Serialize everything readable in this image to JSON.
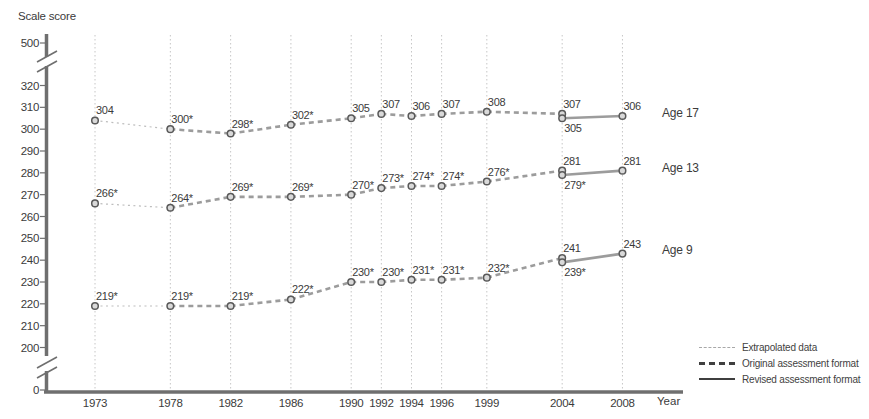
{
  "chart_data": {
    "type": "line",
    "ylabel": "Scale score",
    "xlabel": "Year",
    "x_years": [
      1973,
      1978,
      1982,
      1986,
      1990,
      1992,
      1994,
      1996,
      1999,
      2004,
      2008
    ],
    "y_axis": {
      "ticks": [
        320,
        310,
        300,
        290,
        280,
        270,
        260,
        250,
        240,
        230,
        220,
        210,
        200
      ],
      "top_tick": 500,
      "bottom_tick": 0,
      "has_axis_breaks": true
    },
    "grid": "vertical-dotted",
    "legend_position": "bottom-right",
    "series": [
      {
        "name": "Age 17",
        "points": [
          {
            "year": 1973,
            "value": 304,
            "label": "304",
            "label_pos": "above",
            "to_next": "extrapolated"
          },
          {
            "year": 1978,
            "value": 300,
            "label": "300*",
            "label_pos": "above",
            "to_next": "original"
          },
          {
            "year": 1982,
            "value": 298,
            "label": "298*",
            "label_pos": "above",
            "to_next": "original"
          },
          {
            "year": 1986,
            "value": 302,
            "label": "302*",
            "label_pos": "above",
            "to_next": "original"
          },
          {
            "year": 1990,
            "value": 305,
            "label": "305",
            "label_pos": "above",
            "to_next": "original"
          },
          {
            "year": 1992,
            "value": 307,
            "label": "307",
            "label_pos": "above",
            "to_next": "original"
          },
          {
            "year": 1994,
            "value": 306,
            "label": "306",
            "label_pos": "above",
            "to_next": "original"
          },
          {
            "year": 1996,
            "value": 307,
            "label": "307",
            "label_pos": "above",
            "to_next": "original"
          },
          {
            "year": 1999,
            "value": 308,
            "label": "308",
            "label_pos": "above",
            "to_next": "original"
          },
          {
            "year": 2004,
            "value": 307,
            "label": "307",
            "label_pos": "above",
            "to_next": "none",
            "format": "original"
          },
          {
            "year": 2004,
            "value": 305,
            "label": "305",
            "label_pos": "below",
            "to_next": "revised",
            "format": "revised"
          },
          {
            "year": 2008,
            "value": 306,
            "label": "306",
            "label_pos": "above",
            "to_next": "none",
            "format": "revised"
          }
        ]
      },
      {
        "name": "Age 13",
        "points": [
          {
            "year": 1973,
            "value": 266,
            "label": "266*",
            "label_pos": "above",
            "to_next": "extrapolated"
          },
          {
            "year": 1978,
            "value": 264,
            "label": "264*",
            "label_pos": "above",
            "to_next": "original"
          },
          {
            "year": 1982,
            "value": 269,
            "label": "269*",
            "label_pos": "above",
            "to_next": "original"
          },
          {
            "year": 1986,
            "value": 269,
            "label": "269*",
            "label_pos": "above",
            "to_next": "original"
          },
          {
            "year": 1990,
            "value": 270,
            "label": "270*",
            "label_pos": "above",
            "to_next": "original"
          },
          {
            "year": 1992,
            "value": 273,
            "label": "273*",
            "label_pos": "above",
            "to_next": "original"
          },
          {
            "year": 1994,
            "value": 274,
            "label": "274*",
            "label_pos": "above",
            "to_next": "original"
          },
          {
            "year": 1996,
            "value": 274,
            "label": "274*",
            "label_pos": "above",
            "to_next": "original"
          },
          {
            "year": 1999,
            "value": 276,
            "label": "276*",
            "label_pos": "above",
            "to_next": "original"
          },
          {
            "year": 2004,
            "value": 281,
            "label": "281",
            "label_pos": "above",
            "to_next": "none",
            "format": "original"
          },
          {
            "year": 2004,
            "value": 279,
            "label": "279*",
            "label_pos": "below",
            "to_next": "revised",
            "format": "revised"
          },
          {
            "year": 2008,
            "value": 281,
            "label": "281",
            "label_pos": "above",
            "to_next": "none",
            "format": "revised"
          }
        ]
      },
      {
        "name": "Age 9",
        "points": [
          {
            "year": 1973,
            "value": 219,
            "label": "219*",
            "label_pos": "above",
            "to_next": "extrapolated"
          },
          {
            "year": 1978,
            "value": 219,
            "label": "219*",
            "label_pos": "above",
            "to_next": "original"
          },
          {
            "year": 1982,
            "value": 219,
            "label": "219*",
            "label_pos": "above",
            "to_next": "original"
          },
          {
            "year": 1986,
            "value": 222,
            "label": "222*",
            "label_pos": "above",
            "to_next": "original"
          },
          {
            "year": 1990,
            "value": 230,
            "label": "230*",
            "label_pos": "above",
            "to_next": "original"
          },
          {
            "year": 1992,
            "value": 230,
            "label": "230*",
            "label_pos": "above",
            "to_next": "original"
          },
          {
            "year": 1994,
            "value": 231,
            "label": "231*",
            "label_pos": "above",
            "to_next": "original"
          },
          {
            "year": 1996,
            "value": 231,
            "label": "231*",
            "label_pos": "above",
            "to_next": "original"
          },
          {
            "year": 1999,
            "value": 232,
            "label": "232*",
            "label_pos": "above",
            "to_next": "original"
          },
          {
            "year": 2004,
            "value": 241,
            "label": "241",
            "label_pos": "above",
            "to_next": "none",
            "format": "original"
          },
          {
            "year": 2004,
            "value": 239,
            "label": "239*",
            "label_pos": "below",
            "to_next": "revised",
            "format": "revised"
          },
          {
            "year": 2008,
            "value": 243,
            "label": "243",
            "label_pos": "above",
            "to_next": "none",
            "format": "revised"
          }
        ]
      }
    ],
    "legend": [
      {
        "label": "Extrapolated data",
        "style": "extrapolated"
      },
      {
        "label": "Original assessment format",
        "style": "original"
      },
      {
        "label": "Revised assessment format",
        "style": "revised"
      }
    ]
  },
  "colors": {
    "text": "#3b3b3b",
    "axis": "#6f6f6f",
    "gridline": "#c6c6c6",
    "trend_line": "#9c9c9c",
    "extrapolated_line": "#bdbdbd",
    "point_fill": "#d9d9d9",
    "point_stroke": "#595959",
    "legend_dark": "#3f3f3f",
    "legend_light": "#a8a8a8"
  }
}
